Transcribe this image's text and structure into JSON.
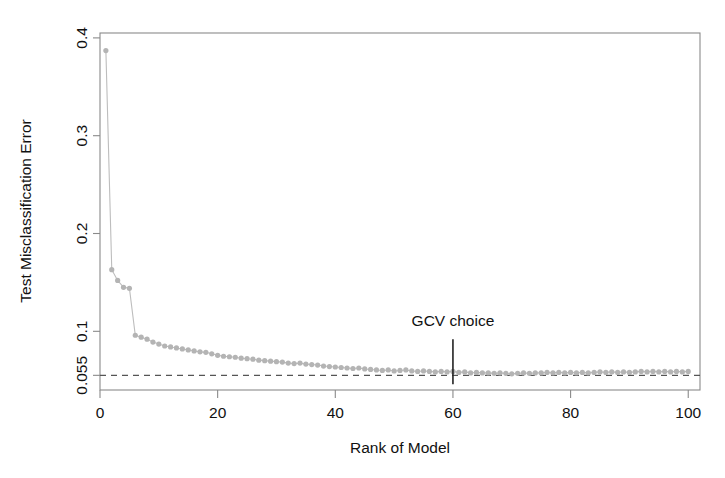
{
  "chart_data": {
    "type": "scatter",
    "title": "",
    "xlabel": "Rank of Model",
    "ylabel": "Test Misclassification Error",
    "xlim": [
      0,
      102
    ],
    "ylim": [
      0.04,
      0.405
    ],
    "grid": false,
    "legend": null,
    "xticks": [
      0,
      20,
      40,
      60,
      80,
      100
    ],
    "xtick_labels": [
      "0",
      "20",
      "40",
      "60",
      "80",
      "100"
    ],
    "yticks": [
      0.055,
      0.1,
      0.2,
      0.3,
      0.4
    ],
    "ytick_labels": [
      "0.055",
      "0.1",
      "0.2",
      "0.3",
      "0.4"
    ],
    "series": [
      {
        "name": "Test Misclassification Error",
        "marker": "filled-circle",
        "color": "#b4b4b4",
        "line_color": "#bdbdbd",
        "x": [
          1,
          2,
          3,
          4,
          5,
          6,
          7,
          8,
          9,
          10,
          11,
          12,
          13,
          14,
          15,
          16,
          17,
          18,
          19,
          20,
          21,
          22,
          23,
          24,
          25,
          26,
          27,
          28,
          29,
          30,
          31,
          32,
          33,
          34,
          35,
          36,
          37,
          38,
          39,
          40,
          41,
          42,
          43,
          44,
          45,
          46,
          47,
          48,
          49,
          50,
          51,
          52,
          53,
          54,
          55,
          56,
          57,
          58,
          59,
          60,
          61,
          62,
          63,
          64,
          65,
          66,
          67,
          68,
          69,
          70,
          71,
          72,
          73,
          74,
          75,
          76,
          77,
          78,
          79,
          80,
          81,
          82,
          83,
          84,
          85,
          86,
          87,
          88,
          89,
          90,
          91,
          92,
          93,
          94,
          95,
          96,
          97,
          98,
          99,
          100
        ],
        "y": [
          0.387,
          0.163,
          0.152,
          0.145,
          0.144,
          0.096,
          0.094,
          0.092,
          0.089,
          0.087,
          0.085,
          0.084,
          0.083,
          0.082,
          0.081,
          0.08,
          0.079,
          0.0785,
          0.077,
          0.0755,
          0.0745,
          0.074,
          0.0735,
          0.0725,
          0.072,
          0.0715,
          0.0705,
          0.07,
          0.0695,
          0.069,
          0.0685,
          0.0675,
          0.067,
          0.0675,
          0.0665,
          0.066,
          0.0655,
          0.0645,
          0.064,
          0.0635,
          0.063,
          0.0625,
          0.062,
          0.0625,
          0.0615,
          0.061,
          0.0605,
          0.06,
          0.0605,
          0.0595,
          0.06,
          0.0605,
          0.0595,
          0.059,
          0.0595,
          0.059,
          0.0585,
          0.059,
          0.0585,
          0.059,
          0.058,
          0.0585,
          0.0575,
          0.058,
          0.0575,
          0.0575,
          0.057,
          0.0575,
          0.057,
          0.0565,
          0.057,
          0.0575,
          0.057,
          0.0575,
          0.0575,
          0.058,
          0.0575,
          0.058,
          0.0575,
          0.058,
          0.0575,
          0.058,
          0.0575,
          0.058,
          0.0585,
          0.058,
          0.0585,
          0.058,
          0.0585,
          0.058,
          0.0585,
          0.059,
          0.0585,
          0.059,
          0.0585,
          0.059,
          0.0585,
          0.059,
          0.0585,
          0.059
        ]
      }
    ],
    "reference_lines": [
      {
        "name": "baseline-error",
        "orientation": "horizontal",
        "value": 0.055,
        "style": "dashed"
      },
      {
        "name": "gcv-choice",
        "orientation": "vertical",
        "value": 60,
        "style": "solid",
        "label": "GCV choice"
      }
    ],
    "annotations": [
      {
        "text": "GCV choice",
        "x": 60,
        "y": 0.105
      }
    ]
  }
}
